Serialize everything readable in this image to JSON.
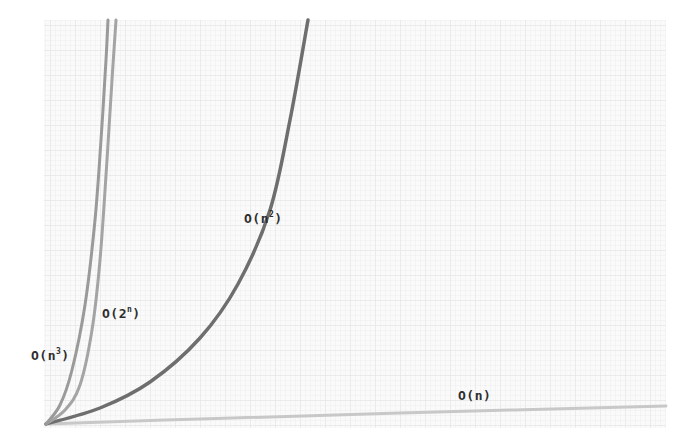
{
  "chart_data": {
    "type": "line",
    "title": "",
    "xlabel": "",
    "ylabel": "",
    "grid": true,
    "legend": "inline labels",
    "series": [
      {
        "name": "O(n)",
        "label_base": "O(n",
        "label_sup": "",
        "label_tail": ")",
        "color": "#c8c8c8",
        "width": 3,
        "points": [
          [
            46,
            424
          ],
          [
            200,
            419
          ],
          [
            400,
            413
          ],
          [
            666,
            406
          ]
        ]
      },
      {
        "name": "O(n²)",
        "label_base": "O(n",
        "label_sup": "2",
        "label_tail": ")",
        "color": "#6e6e6e",
        "width": 3.5,
        "points": [
          [
            46,
            424
          ],
          [
            100,
            408
          ],
          [
            150,
            382
          ],
          [
            200,
            338
          ],
          [
            238,
            284
          ],
          [
            270,
            210
          ],
          [
            290,
            120
          ],
          [
            308,
            20
          ]
        ]
      },
      {
        "name": "O(2ⁿ)",
        "label_base": "O(2",
        "label_sup": "n",
        "label_tail": ")",
        "color": "#a4a4a4",
        "width": 3,
        "points": [
          [
            46,
            424
          ],
          [
            65,
            410
          ],
          [
            80,
            385
          ],
          [
            92,
            330
          ],
          [
            100,
            260
          ],
          [
            107,
            160
          ],
          [
            112,
            80
          ],
          [
            116,
            20
          ]
        ]
      },
      {
        "name": "O(n³)",
        "label_base": "O(n",
        "label_sup": "3",
        "label_tail": ")",
        "color": "#9a9a9a",
        "width": 3,
        "points": [
          [
            46,
            424
          ],
          [
            60,
            405
          ],
          [
            72,
            370
          ],
          [
            85,
            305
          ],
          [
            95,
            220
          ],
          [
            101,
            140
          ],
          [
            106,
            60
          ],
          [
            108,
            20
          ]
        ]
      }
    ],
    "plot_area": {
      "x": 44,
      "y": 20,
      "width": 622,
      "height": 408
    },
    "label_positions": {
      "O(n)": {
        "x": 458,
        "y": 388
      },
      "O(n²)": {
        "x": 244,
        "y": 210
      },
      "O(2ⁿ)": {
        "x": 102,
        "y": 305
      },
      "O(n³)": {
        "x": 31,
        "y": 347
      }
    }
  },
  "colors": {
    "background": "#ffffff",
    "grid_fine": "#ededed",
    "grid_bg": "#f9f9f9",
    "label": "#2e2e2e"
  }
}
